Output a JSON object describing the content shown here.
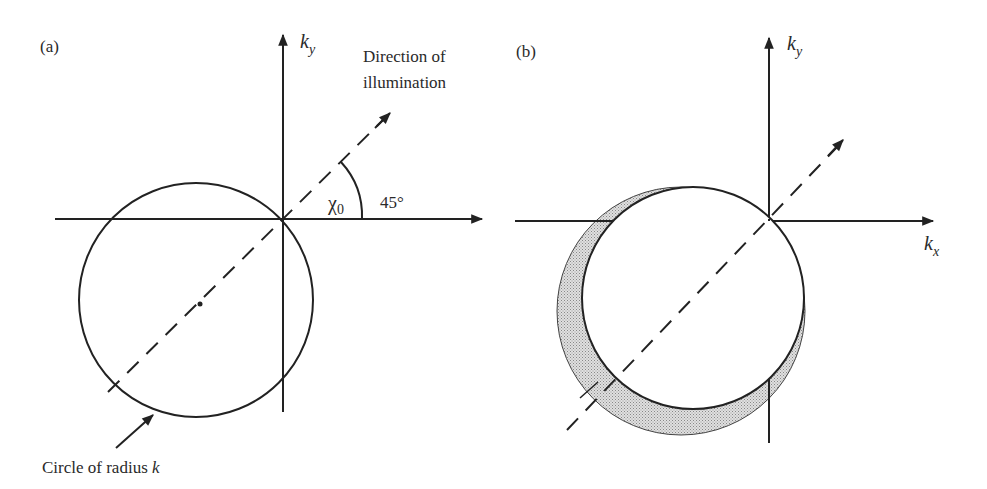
{
  "panel_a": {
    "label": "(a)",
    "axis_y_label": "k",
    "axis_y_sub": "y",
    "direction_label_line1": "Direction of",
    "direction_label_line2": "illumination",
    "angle_symbol": "χ",
    "angle_sub": "0",
    "angle_value": "45°",
    "circle_caption": "Circle of radius ",
    "circle_caption_var": "k"
  },
  "panel_b": {
    "label": "(b)",
    "axis_y_label": "k",
    "axis_y_sub": "y",
    "axis_x_label": "k",
    "axis_x_sub": "x"
  },
  "colors": {
    "line": "#222222",
    "shade": "#c8c8c8",
    "background": "#ffffff"
  }
}
